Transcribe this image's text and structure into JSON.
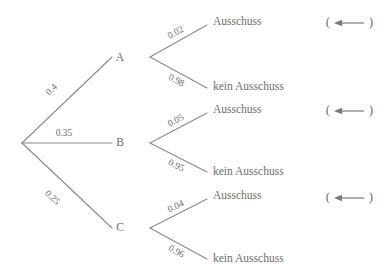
{
  "diagram": {
    "type": "probability-tree",
    "colors": {
      "background": "#ffffff",
      "edge": "#8a8a8a",
      "text": "#6d6d6d",
      "arrow": "#7a7a7a"
    },
    "root": {
      "label": ""
    },
    "level1": [
      {
        "node_label": "A",
        "probability": "0.4",
        "children": [
          {
            "probability": "0.02",
            "label": "Ausschuss"
          },
          {
            "probability": "0.98",
            "label": "kein Ausschuss"
          }
        ]
      },
      {
        "node_label": "B",
        "probability": "0.35",
        "children": [
          {
            "probability": "0.05",
            "label": "Ausschuss"
          },
          {
            "probability": "0.95",
            "label": "kein Ausschuss"
          }
        ]
      },
      {
        "node_label": "C",
        "probability": "0.25",
        "children": [
          {
            "probability": "0.04",
            "label": "Ausschuss"
          },
          {
            "probability": "0.96",
            "label": "kein Ausschuss"
          }
        ]
      }
    ],
    "annotations": [
      {
        "open_paren": "(",
        "close_paren": ")",
        "icon": "left-arrow-icon"
      },
      {
        "open_paren": "(",
        "close_paren": ")",
        "icon": "left-arrow-icon"
      },
      {
        "open_paren": "(",
        "close_paren": ")",
        "icon": "left-arrow-icon"
      }
    ]
  }
}
